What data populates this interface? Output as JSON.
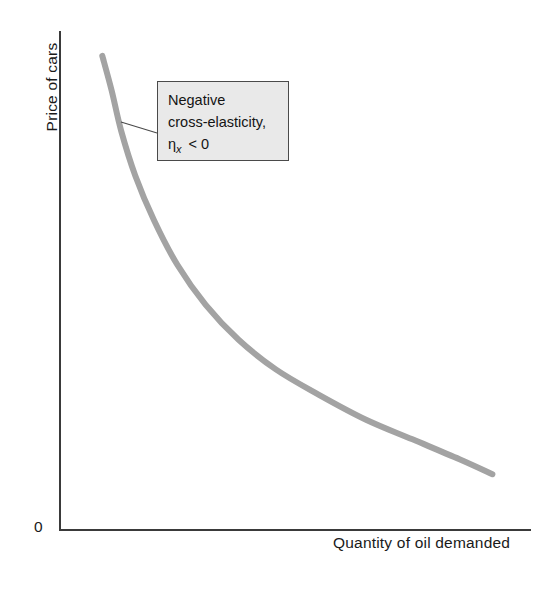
{
  "figure": {
    "origin_label": "0",
    "annotation": {
      "line1": "Negative",
      "line2": "cross-elasticity,",
      "symbol": "η",
      "subscript": "x",
      "relation": "< 0"
    }
  },
  "chart_data": {
    "type": "line",
    "title": "",
    "xlabel": "Quantity of oil demanded",
    "ylabel": "Price of cars",
    "xlim": [
      0,
      100
    ],
    "ylim": [
      0,
      100
    ],
    "grid": false,
    "legend": null,
    "axis_tick_labels": {
      "x": [],
      "y": []
    },
    "origin_label": "0",
    "annotations": [
      {
        "text": "Negative cross-elasticity, ηx < 0",
        "box": true,
        "leader_from": [
          13,
          91
        ],
        "leader_to": [
          22,
          84
        ]
      }
    ],
    "series": [
      {
        "name": "Demand relationship (negative cross-elasticity)",
        "color": "#a3a3a3",
        "width": 6,
        "x": [
          9,
          11,
          13,
          16,
          20,
          25,
          31,
          38,
          46,
          55,
          65,
          75,
          85,
          92
        ],
        "y": [
          95,
          88,
          80,
          71,
          62,
          53,
          45,
          38,
          32,
          27,
          22,
          18,
          14,
          11
        ]
      }
    ]
  }
}
